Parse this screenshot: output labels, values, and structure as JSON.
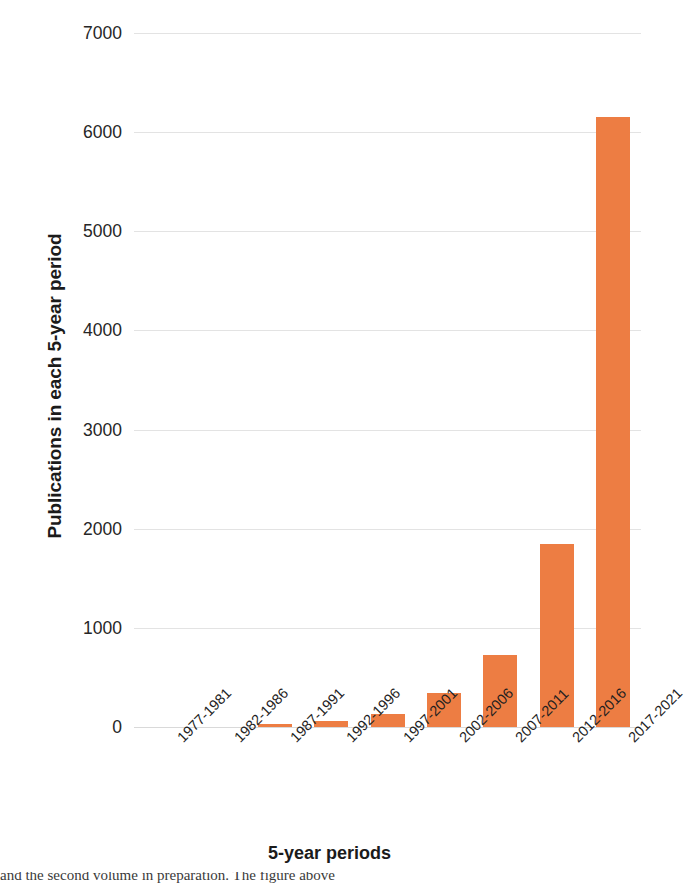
{
  "chart_data": {
    "type": "bar",
    "title": "",
    "xlabel": "5-year periods",
    "ylabel": "Publications in each 5-year period",
    "categories": [
      "1977-1981",
      "1982-1986",
      "1987-1991",
      "1992-1996",
      "1997-2001",
      "2002-2006",
      "2007-2011",
      "2012-2016",
      "2017-2021"
    ],
    "values": [
      0,
      0,
      30,
      65,
      135,
      340,
      730,
      1850,
      6150
    ],
    "ylim": [
      0,
      7000
    ],
    "yticks": [
      "0",
      "1000",
      "2000",
      "3000",
      "4000",
      "5000",
      "6000",
      "7000"
    ],
    "ytick_values": [
      0,
      1000,
      2000,
      3000,
      4000,
      5000,
      6000,
      7000
    ],
    "grid": true,
    "legend": false,
    "bar_color": "#ED7D43",
    "gridline_color": "#E3E3E3",
    "background_color": "#FFFFFF",
    "xtick_rotation_deg": -45
  },
  "caption": {
    "partial_line": "and the second volume in preparation. The figure above"
  }
}
